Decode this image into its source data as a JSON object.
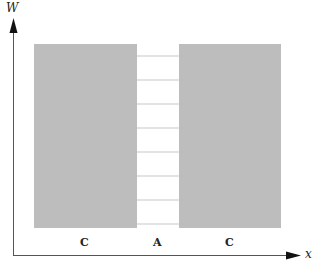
{
  "diagram": {
    "axes": {
      "y_label": "W",
      "x_label": "x"
    },
    "regions": [
      {
        "id": "left",
        "label": "C"
      },
      {
        "id": "middle",
        "label": "A"
      },
      {
        "id": "right",
        "label": "C"
      }
    ],
    "colors": {
      "region_fill": "#bdbdbd",
      "axis": "#555555",
      "rung": "#c8c8c8",
      "arrow": "#111111"
    },
    "middle_rungs": 8
  }
}
